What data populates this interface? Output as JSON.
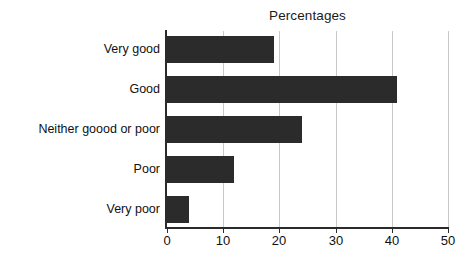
{
  "chart_data": {
    "type": "bar",
    "orientation": "horizontal",
    "title": "Percentages",
    "xlabel": "",
    "ylabel": "",
    "xlim": [
      0,
      50
    ],
    "xticks": [
      0,
      10,
      20,
      30,
      40,
      50
    ],
    "xtick_labels": [
      "0",
      "10",
      "20",
      "30",
      "40",
      "50"
    ],
    "grid": "vertical",
    "legend": "none",
    "categories": [
      "Very good",
      "Good",
      "Neither goood or poor",
      "Poor",
      "Very poor"
    ],
    "values": [
      19,
      41,
      24,
      12,
      4
    ],
    "series": [
      {
        "name": "Percentages",
        "values": [
          19,
          41,
          24,
          12,
          4
        ]
      }
    ],
    "colors": {
      "bar": "#2b2b2b",
      "gridline": "#c9c9c9",
      "axis": "#2b2b2b",
      "background": "#ffffff",
      "text": "#111111"
    }
  }
}
